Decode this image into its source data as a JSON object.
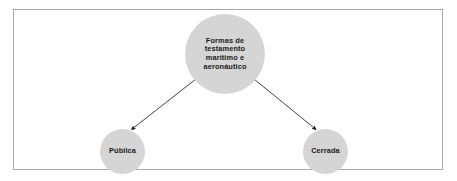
{
  "diagram": {
    "type": "hierarchy-tree",
    "title": "Formas de testamento marítimo e aeronáutico",
    "frame": {
      "border_color": "#a8a8a8",
      "background_color": "#ffffff"
    },
    "node_fill_color": "#d5d5d5",
    "node_text_color": "#1b1b1b",
    "edge_color": "#2b2b2b",
    "nodes": [
      {
        "id": "root",
        "label": "Formas de testamento marítimo e aeronáutico",
        "lines": [
          "Formas de",
          "testamento",
          "marítimo e",
          "aeronáutico"
        ],
        "shape": "circle",
        "cx": 225,
        "cy": 54,
        "diameter": 80
      },
      {
        "id": "publica",
        "label": "Pública",
        "lines": [
          "Pública"
        ],
        "shape": "circle",
        "cx": 122,
        "cy": 151,
        "diameter": 45
      },
      {
        "id": "cerrada",
        "label": "Cerrada",
        "lines": [
          "Cerrada"
        ],
        "shape": "circle",
        "cx": 325,
        "cy": 151,
        "diameter": 45
      }
    ],
    "edges": [
      {
        "id": "root-to-publica",
        "from": "root",
        "to": "publica",
        "style": "solid-line-with-arrowhead",
        "source_marker": "dot"
      },
      {
        "id": "root-to-cerrada",
        "from": "root",
        "to": "cerrada",
        "style": "solid-line-with-arrowhead",
        "source_marker": "dot"
      }
    ]
  }
}
